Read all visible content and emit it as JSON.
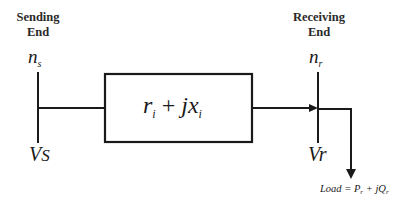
{
  "diagram": {
    "type": "single-line power distribution branch",
    "sending_end": {
      "title_line1": "Sending",
      "title_line2": "End",
      "node": "n",
      "node_sub": "s",
      "voltage": "V",
      "voltage_sub": "S"
    },
    "receiving_end": {
      "title_line1": "Receiving",
      "title_line2": "End",
      "node": "n",
      "node_sub": "r",
      "voltage": "V",
      "voltage_sub": "r"
    },
    "branch": {
      "r": "r",
      "r_sub": "i",
      "plus": " + ",
      "jx": "jx",
      "x_sub": "i"
    },
    "load": {
      "prefix": "Load = P",
      "p_sub": "r",
      "plus": " + jQ",
      "q_sub": "r"
    },
    "colors": {
      "line": "#1a1a1a",
      "background": "#ffffff"
    }
  }
}
